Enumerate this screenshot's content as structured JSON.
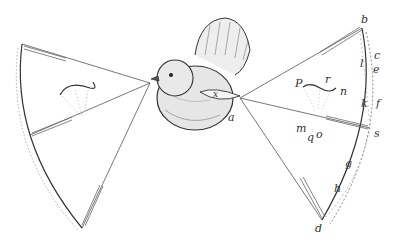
{
  "figure": {
    "labels": {
      "b": "b",
      "c": "c",
      "l": "l",
      "e": "e",
      "P": "P",
      "r": "r",
      "n": "n",
      "k": "k",
      "f": "f",
      "m": "m",
      "q": "q",
      "o": "o",
      "s": "s",
      "g": "g",
      "h": "h",
      "d": "d",
      "a": "a",
      "x": "x"
    }
  }
}
